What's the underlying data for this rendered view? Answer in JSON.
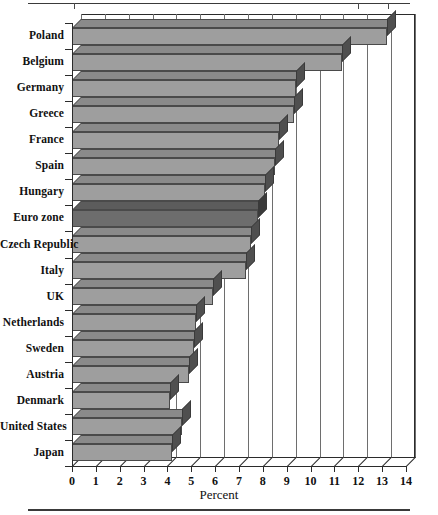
{
  "figure": {
    "axis_title": "Percent",
    "top_rule": true,
    "bottom_rule": true
  },
  "chart_data": {
    "type": "bar",
    "orientation": "horizontal",
    "style": "3d-horizontal-bar",
    "title": "",
    "subtitle": "",
    "xlabel": "Percent",
    "ylabel": "",
    "xlim": [
      0,
      14
    ],
    "xticks": [
      "0",
      "1",
      "2",
      "3",
      "4",
      "5",
      "6",
      "7",
      "8",
      "9",
      "10",
      "11",
      "12",
      "13",
      "14"
    ],
    "grid": "vertical",
    "legend": "none",
    "highlight_category": "Euro zone",
    "categories": [
      "Poland",
      "Belgium",
      "Germany",
      "Greece",
      "France",
      "Spain",
      "Hungary",
      "Euro zone",
      "Czech Republic",
      "Italy",
      "UK",
      "Netherlands",
      "Sweden",
      "Austria",
      "Denmark",
      "United States",
      "Japan"
    ],
    "values": [
      13.2,
      11.3,
      9.4,
      9.3,
      8.7,
      8.5,
      8.1,
      7.8,
      7.5,
      7.3,
      5.9,
      5.2,
      5.1,
      4.9,
      4.1,
      4.6,
      4.2
    ],
    "bar_colors": {
      "default_front": "#9e9e9e",
      "default_top": "#8a8a8a",
      "default_side": "#4f4f4f",
      "highlight_front": "#6d6d6d",
      "highlight_top": "#5c5c5c",
      "highlight_side": "#3a3a3a",
      "outline": "#4a4a4a"
    }
  }
}
